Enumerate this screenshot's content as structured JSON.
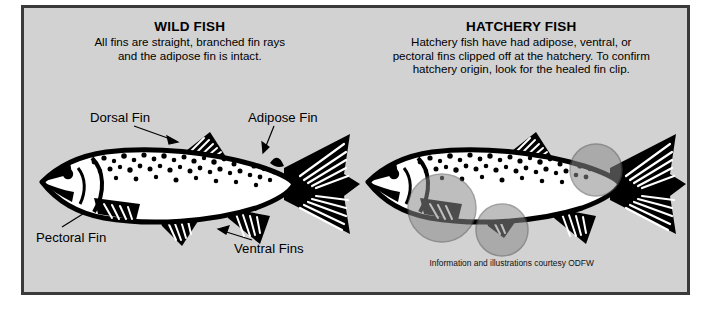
{
  "poster": {
    "background_color": "#d2d2d2",
    "border_color": "#3a3a3a",
    "page_background": "#ffffff"
  },
  "left_panel": {
    "heading": "WILD FISH",
    "body_lines": [
      "All fins are straight, branched fin rays",
      "and the adipose fin is intact."
    ],
    "illustration_name": "wild-fish-illustration",
    "callouts": [
      {
        "label": "Dorsal Fin",
        "name": "callout-dorsal-fin"
      },
      {
        "label": "Adipose Fin",
        "name": "callout-adipose-fin"
      },
      {
        "label": "Pectoral Fin",
        "name": "callout-pectoral-fin"
      },
      {
        "label": "Ventral Fins",
        "name": "callout-ventral-fins"
      }
    ]
  },
  "right_panel": {
    "heading": "HATCHERY FISH",
    "body_lines": [
      "Hatchery fish have had adipose, ventral, or",
      "pectoral fins clipped off at the hatchery. To confirm",
      "hatchery origin, look for the healed fin clip."
    ],
    "illustration_name": "hatchery-fish-illustration",
    "highlight_color": "#8a8a8a",
    "highlights": [
      {
        "name": "highlight-adipose-clip"
      },
      {
        "name": "highlight-pectoral-clip"
      },
      {
        "name": "highlight-ventral-clip"
      }
    ],
    "credit": "Information and illustrations courtesy ODFW"
  },
  "fish_art": {
    "outline_color": "#000000",
    "body_color": "#ffffff",
    "spot_color": "#000000"
  }
}
